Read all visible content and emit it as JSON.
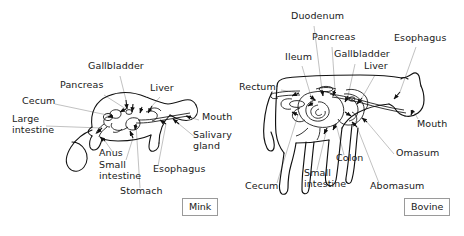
{
  "figure": {
    "background_color": "#ffffff",
    "outline_color": "#111111",
    "leader_line_color": "#9e9e9e",
    "text_color": "#202020"
  },
  "panels": [
    {
      "id": "mink",
      "tag_label": "Mink",
      "animal": "mink",
      "labels": [
        {
          "name": "gallbladder",
          "text": "Gallbladder",
          "x": 88,
          "y": 66,
          "align": "left"
        },
        {
          "name": "pancreas",
          "text": "Pancreas",
          "x": 60,
          "y": 85,
          "align": "left"
        },
        {
          "name": "liver",
          "text": "Liver",
          "x": 150,
          "y": 88,
          "align": "left"
        },
        {
          "name": "cecum",
          "text": "Cecum",
          "x": 22,
          "y": 101,
          "align": "left"
        },
        {
          "name": "large-intestine",
          "text": "Large\nintestine",
          "x": 12,
          "y": 119,
          "align": "left"
        },
        {
          "name": "mouth",
          "text": "Mouth",
          "x": 202,
          "y": 117,
          "align": "left"
        },
        {
          "name": "salivary-gland",
          "text": "Salivary\ngland",
          "x": 193,
          "y": 135,
          "align": "left"
        },
        {
          "name": "anus",
          "text": "Anus",
          "x": 99,
          "y": 152,
          "align": "left"
        },
        {
          "name": "small-intestine",
          "text": "Small\nintestine",
          "x": 99,
          "y": 164,
          "align": "left"
        },
        {
          "name": "esophagus",
          "text": "Esophagus",
          "x": 153,
          "y": 168,
          "align": "left"
        },
        {
          "name": "stomach",
          "text": "Stomach",
          "x": 120,
          "y": 190,
          "align": "left"
        }
      ]
    },
    {
      "id": "bovine",
      "tag_label": "Bovine",
      "animal": "bovine",
      "labels": [
        {
          "name": "duodenum",
          "text": "Duodenum",
          "x": 291,
          "y": 15,
          "align": "left"
        },
        {
          "name": "pancreas",
          "text": "Pancreas",
          "x": 312,
          "y": 36,
          "align": "left"
        },
        {
          "name": "esophagus",
          "text": "Esophagus",
          "x": 394,
          "y": 37,
          "align": "left"
        },
        {
          "name": "gallbladder",
          "text": "Gallbladder",
          "x": 334,
          "y": 53,
          "align": "left"
        },
        {
          "name": "liver",
          "text": "Liver",
          "x": 364,
          "y": 65,
          "align": "left"
        },
        {
          "name": "ileum",
          "text": "Ileum",
          "x": 285,
          "y": 56,
          "align": "left"
        },
        {
          "name": "rectum",
          "text": "Rectum",
          "x": 239,
          "y": 86,
          "align": "left"
        },
        {
          "name": "mouth",
          "text": "Mouth",
          "x": 417,
          "y": 123,
          "align": "left"
        },
        {
          "name": "colon",
          "text": "Colon",
          "x": 336,
          "y": 157,
          "align": "left"
        },
        {
          "name": "omasum",
          "text": "Omasum",
          "x": 396,
          "y": 152,
          "align": "left"
        },
        {
          "name": "cecum",
          "text": "Cecum",
          "x": 245,
          "y": 185,
          "align": "left"
        },
        {
          "name": "small-intestine",
          "text": "Small\nintestine",
          "x": 304,
          "y": 172,
          "align": "left"
        },
        {
          "name": "abomasum",
          "text": "Abomasum",
          "x": 370,
          "y": 185,
          "align": "left"
        }
      ]
    }
  ],
  "tags": {
    "mink": {
      "label": "Mink",
      "x": 182,
      "y": 198
    },
    "bovine": {
      "label": "Bovine",
      "x": 404,
      "y": 198
    }
  }
}
